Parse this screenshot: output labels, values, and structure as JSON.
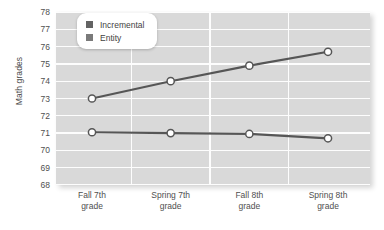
{
  "chart_data": {
    "type": "line",
    "title": "",
    "xlabel": "",
    "ylabel": "Math grades",
    "ylim": [
      68,
      78
    ],
    "ytick_step": 1,
    "yticks": [
      78,
      77,
      76,
      75,
      74,
      73,
      72,
      71,
      70,
      69,
      68
    ],
    "grid": true,
    "legend_position": "top-left",
    "categories": [
      "Fall 7th\ngrade",
      "Spring 7th\ngrade",
      "Fall 8th\ngrade",
      "Spring 8th\ngrade"
    ],
    "category_lines": [
      [
        "Fall 7th",
        "grade"
      ],
      [
        "Spring 7th",
        "grade"
      ],
      [
        "Fall 8th",
        "grade"
      ],
      [
        "Spring 8th",
        "grade"
      ]
    ],
    "series": [
      {
        "name": "Incremental",
        "color": "#565656",
        "marker": "circle-open",
        "values": [
          73.0,
          74.0,
          74.9,
          75.7
        ]
      },
      {
        "name": "Entity",
        "color": "#565656",
        "marker": "circle-open",
        "values": [
          71.05,
          71.0,
          70.95,
          70.7
        ]
      }
    ]
  },
  "legend": {
    "items": [
      {
        "label": "Incremental",
        "swatch_color": "#636363"
      },
      {
        "label": "Entity",
        "swatch_color": "#7a7a7a"
      }
    ]
  },
  "style": {
    "plot_background": "#d9d9d9",
    "gridline_color": "#fdfdfd",
    "axis_text_color": "#4f4f4f",
    "line_color": "#565656",
    "marker_fill": "#ffffff"
  }
}
